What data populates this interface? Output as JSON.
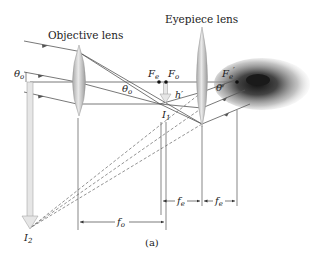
{
  "figure": {
    "caption": "(a)",
    "labels": {
      "objective_lens": "Objective lens",
      "eyepiece_lens": "Eyepiece lens",
      "theta_o_left": "θ",
      "theta_o_left_sub": "o",
      "theta_o_mid": "θ",
      "theta_o_mid_sub": "o",
      "theta": "θ",
      "F_e": "F",
      "F_e_sub": "e",
      "F_o": "F",
      "F_o_sub": "o",
      "F_e_prime": "F",
      "F_e_prime_sub": "e",
      "F_e_prime_mark": "′",
      "h_prime": "h′",
      "I1": "I",
      "I1_sub": "1",
      "I2": "I",
      "I2_sub": "2",
      "f_o": "f",
      "f_o_sub": "o",
      "f_e_1": "f",
      "f_e_1_sub": "e",
      "f_e_2": "f",
      "f_e_2_sub": "e"
    },
    "colors": {
      "lens_fill": "#c9c9c9",
      "arrow_fill": "#e4e4e4",
      "ray": "#555555",
      "eye": "#2a2a2a"
    }
  }
}
